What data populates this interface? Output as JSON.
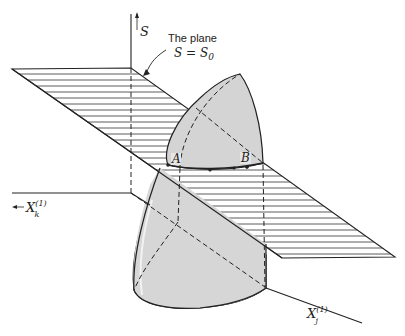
{
  "figure": {
    "axes": {
      "vertical": {
        "label": "S"
      },
      "left": {
        "label": "X",
        "subscript": "k",
        "superscript": "(1)"
      },
      "diagonal": {
        "label": "X",
        "subscript": "j",
        "superscript": "(1)"
      }
    },
    "plane_annotation": {
      "line1": "The plane",
      "line2_lhs": "S = S",
      "line2_sub": "0"
    },
    "points": [
      {
        "label": "A"
      },
      {
        "label": "B"
      }
    ],
    "colors": {
      "line": "#222222",
      "surface_fill": "#d4d4d4",
      "background": "#ffffff"
    }
  }
}
